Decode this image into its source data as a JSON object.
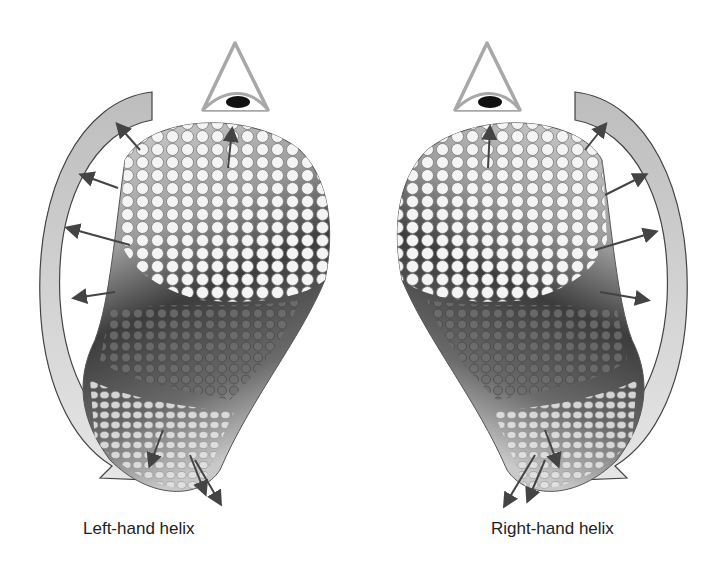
{
  "figure": {
    "panels": [
      {
        "id": "left",
        "caption": "Left-hand helix",
        "handedness": "left"
      },
      {
        "id": "right",
        "caption": "Right-hand helix",
        "handedness": "right"
      }
    ],
    "icons": {
      "viewer": "eye-icon",
      "rotation": "curved-arrow-icon",
      "vectors": "vector-arrow-icon"
    },
    "colors": {
      "background": "#ffffff",
      "rod_top": "#f2f2f2",
      "rod_mid": "#8a8a8a",
      "rod_dark": "#3a3a3a",
      "rod_light": "#c8c8c8",
      "eye_outline": "#a8a8a8",
      "pupil": "#111111",
      "arrow": "#444444",
      "curve_fill": "#bdbdbd",
      "text": "#222222"
    }
  }
}
